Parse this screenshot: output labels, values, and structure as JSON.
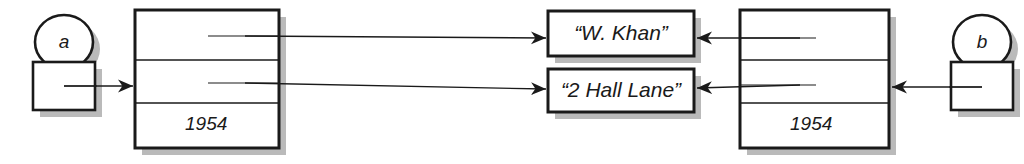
{
  "diagram": {
    "type": "object-diagram",
    "background_color": "#ffffff",
    "stroke_color": "#1a1a1a",
    "fill_color": "#ffffff",
    "shadow_color": "#aaaaaa"
  },
  "variables": [
    {
      "id": "a",
      "label": "a",
      "side": "left",
      "oval": {
        "cx": 64,
        "cy": 42,
        "rx": 29,
        "ry": 27
      },
      "box": {
        "x": 33,
        "y": 62,
        "w": 62,
        "h": 48
      },
      "stub": {
        "x1": 64,
        "y1": 86,
        "x2": 96,
        "y2": 86
      }
    },
    {
      "id": "b",
      "label": "b",
      "side": "right",
      "oval": {
        "cx": 982,
        "cy": 42,
        "rx": 29,
        "ry": 27
      },
      "box": {
        "x": 951,
        "y": 62,
        "w": 62,
        "h": 48
      },
      "stub": {
        "x1": 982,
        "y1": 87,
        "x2": 950,
        "y2": 87
      }
    }
  ],
  "objects": [
    {
      "id": "left-object",
      "side": "left",
      "box": {
        "x": 135,
        "y": 10,
        "w": 144,
        "h": 138
      },
      "row_dividers_y": [
        60,
        103
      ],
      "rows": [
        {
          "index": 0,
          "kind": "attribute-slot",
          "label": ""
        },
        {
          "index": 1,
          "kind": "attribute-slot",
          "label": ""
        },
        {
          "index": 2,
          "kind": "value",
          "label": "1954"
        }
      ],
      "year_label": "1954",
      "year_label_pos": {
        "x": 185,
        "y": 113
      },
      "attribute_stubs": [
        {
          "x1": 208,
          "y1": 36,
          "x2": 279,
          "y2": 36
        },
        {
          "x1": 208,
          "y1": 83,
          "x2": 279,
          "y2": 83
        }
      ]
    },
    {
      "id": "right-object",
      "side": "right",
      "box": {
        "x": 740,
        "y": 10,
        "w": 149,
        "h": 138
      },
      "row_dividers_y": [
        60,
        103
      ],
      "rows": [
        {
          "index": 0,
          "kind": "attribute-slot",
          "label": ""
        },
        {
          "index": 1,
          "kind": "attribute-slot",
          "label": ""
        },
        {
          "index": 2,
          "kind": "value",
          "label": "1954"
        }
      ],
      "year_label": "1954",
      "year_label_pos": {
        "x": 790,
        "y": 113
      },
      "attribute_stubs": [
        {
          "x1": 816,
          "y1": 38,
          "x2": 740,
          "y2": 38
        },
        {
          "x1": 816,
          "y1": 85,
          "x2": 740,
          "y2": 85
        }
      ]
    }
  ],
  "string_objects": [
    {
      "id": "string-name",
      "label": "“W. Khan”",
      "box": {
        "x": 548,
        "y": 11,
        "w": 146,
        "h": 45
      },
      "text_pos": {
        "x": 548,
        "y": 21,
        "w": 146
      }
    },
    {
      "id": "string-address",
      "label": "“2 Hall Lane”",
      "box": {
        "x": 548,
        "y": 69,
        "w": 146,
        "h": 43
      },
      "text_pos": {
        "x": 548,
        "y": 78,
        "w": 146
      }
    }
  ],
  "arrows": [
    {
      "id": "arrow-a-to-left-object",
      "from": "variable-a",
      "to": "left-object",
      "direction": "right",
      "x1": 64,
      "y1": 86,
      "x2": 133,
      "y2": 86
    },
    {
      "id": "arrow-left-object-name-to-string-name",
      "from": "left-object-row-1",
      "to": "string-name",
      "direction": "right",
      "x1": 208,
      "y1": 36,
      "x2": 546,
      "y2": 38
    },
    {
      "id": "arrow-left-object-address-to-string-address",
      "from": "left-object-row-2",
      "to": "string-address",
      "direction": "right",
      "x1": 208,
      "y1": 83,
      "x2": 546,
      "y2": 89
    },
    {
      "id": "arrow-right-object-name-to-string-name",
      "from": "right-object-row-1",
      "to": "string-name",
      "direction": "left",
      "x1": 816,
      "y1": 38,
      "x2": 697,
      "y2": 38
    },
    {
      "id": "arrow-right-object-address-to-string-address",
      "from": "right-object-row-2",
      "to": "string-address",
      "direction": "left",
      "x1": 816,
      "y1": 85,
      "x2": 697,
      "y2": 88
    },
    {
      "id": "arrow-b-to-right-object",
      "from": "variable-b",
      "to": "right-object",
      "direction": "left",
      "x1": 982,
      "y1": 87,
      "x2": 891,
      "y2": 87
    }
  ]
}
